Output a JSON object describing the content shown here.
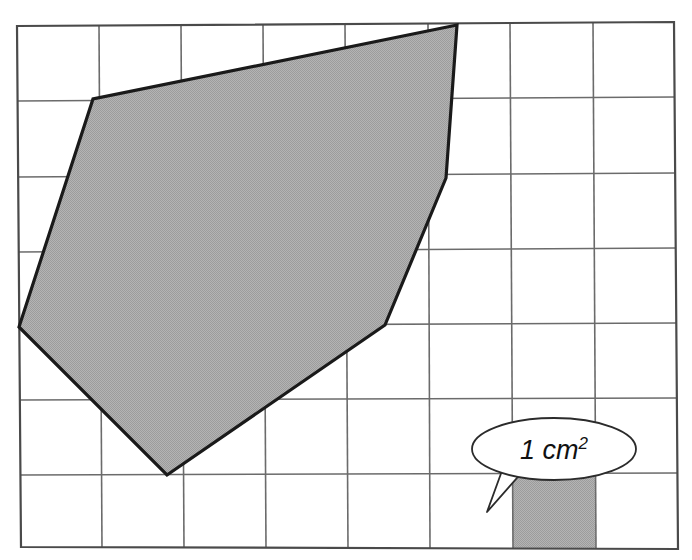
{
  "figure": {
    "type": "geometry-area-diagram",
    "canvas": {
      "width": 692,
      "height": 560
    },
    "background_color": "#ffffff"
  },
  "grid": {
    "name": "centimetre-grid",
    "columns": 8,
    "rows": 7,
    "cell_label": "1 cm²",
    "line_color": "#6b6b6b",
    "border_color": "#4a4a4a",
    "line_width": 1.6,
    "border_width": 2.2,
    "fill_color": "#ffffff",
    "corners": {
      "top_left": [
        17,
        26
      ],
      "top_right": [
        674,
        22
      ],
      "bottom_right": [
        678,
        549
      ],
      "bottom_left": [
        21,
        547
      ]
    },
    "x_positions": [
      17,
      99,
      181,
      263,
      375,
      457,
      512,
      595,
      677
    ],
    "y_positions": [
      25,
      101,
      177,
      252,
      326,
      400,
      475,
      549
    ]
  },
  "shape": {
    "name": "shaded-polygon",
    "sides": 5,
    "fill_color": "#a9a9a9",
    "stroke_color": "#1a1a1a",
    "stroke_width": 3.2,
    "area_cm2": 18,
    "vertices": [
      {
        "label": "top-right",
        "x": 457,
        "y": 25
      },
      {
        "label": "upper-left",
        "x": 93,
        "y": 99
      },
      {
        "label": "left",
        "x": 19,
        "y": 327
      },
      {
        "label": "bottom",
        "x": 167,
        "y": 475
      },
      {
        "label": "lower-right",
        "x": 385,
        "y": 325
      },
      {
        "label": "right",
        "x": 446,
        "y": 178
      }
    ]
  },
  "unit_cell": {
    "name": "unit-square-highlight",
    "column_index": 6,
    "row_index": 6,
    "fill_color": "#a9a9a9",
    "bounds": {
      "x": 512,
      "y": 475,
      "width": 83,
      "height": 74
    }
  },
  "callout": {
    "name": "unit-area-callout",
    "label": "1 cm",
    "superscript": "2",
    "full_text": "1 cm²",
    "fill_color": "#ffffff",
    "stroke_color": "#2b2b2b",
    "stroke_width": 1.8,
    "ellipse": {
      "cx": 554,
      "cy": 449,
      "rx": 82,
      "ry": 31
    },
    "tail_points": "503,470 512,497 487,512 519,473"
  }
}
